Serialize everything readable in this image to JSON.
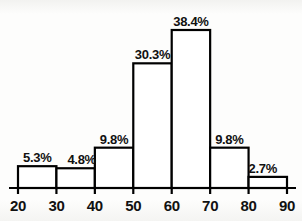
{
  "chart_data": {
    "type": "bar",
    "title": "",
    "xlabel": "",
    "ylabel": "",
    "grid": false,
    "legend": false,
    "bin_edges": [
      20,
      30,
      40,
      50,
      60,
      70,
      80,
      90
    ],
    "categories": [
      "20-30",
      "30-40",
      "40-50",
      "50-60",
      "60-70",
      "70-80",
      "80-90"
    ],
    "values": [
      5.3,
      4.8,
      9.8,
      30.3,
      38.4,
      9.8,
      2.7
    ],
    "value_labels": [
      "5.3%",
      "4.8%",
      "9.8%",
      "30.3%",
      "38.4%",
      "9.8%",
      "2.7%"
    ],
    "xtick_labels": [
      "20",
      "30",
      "40",
      "50",
      "60",
      "70",
      "80",
      "90"
    ],
    "xlim": [
      20,
      90
    ],
    "ylim": [
      0,
      38.4
    ],
    "units": "percent",
    "colors": {
      "bar_fill": "#ffffff",
      "bar_stroke": "#000000",
      "axis": "#000000",
      "text": "#111111",
      "background": "#fdfdfc"
    }
  }
}
